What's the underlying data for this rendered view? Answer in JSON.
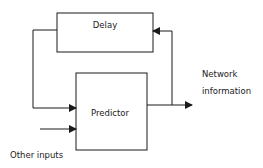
{
  "diagram": {
    "blocks": [
      {
        "id": "delay",
        "label": "Delay"
      },
      {
        "id": "predictor",
        "label": "Predictor"
      }
    ],
    "labels": {
      "output_line1": "Network",
      "output_line2": "information",
      "other_inputs": "Other inputs"
    },
    "edges": [
      {
        "from": "predictor",
        "to": "output",
        "label": "Network information"
      },
      {
        "from": "output",
        "to": "delay",
        "label": "feedback"
      },
      {
        "from": "delay",
        "to": "predictor",
        "label": ""
      },
      {
        "from": "other_inputs",
        "to": "predictor",
        "label": "Other inputs"
      }
    ],
    "colors": {
      "stroke": "#1a1a1a",
      "background": "#ffffff"
    }
  }
}
